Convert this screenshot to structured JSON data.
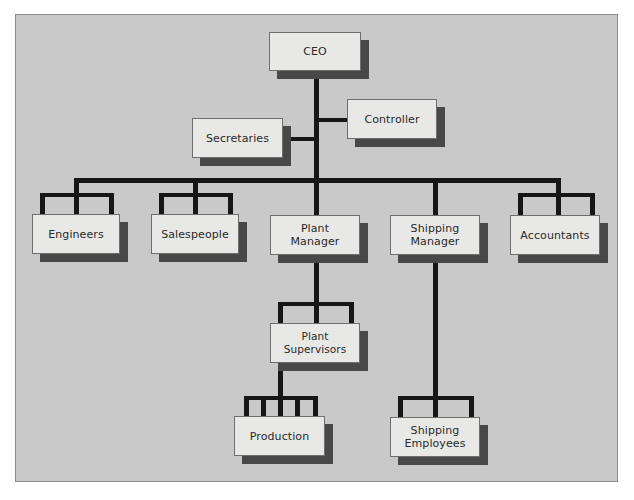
{
  "diagram": {
    "type": "organization-chart",
    "colors": {
      "background": "#c9c9c9",
      "box_fill": "#e8e8e6",
      "box_shadow": "#484848",
      "connector": "#161616"
    },
    "nodes": {
      "ceo": "CEO",
      "controller": "Controller",
      "secretaries": "Secretaries",
      "engineers": "Engineers",
      "salespeople": "Salespeople",
      "plant_manager": "Plant\nManager",
      "shipping_manager": "Shipping\nManager",
      "accountants": "Accountants",
      "plant_supervisors": "Plant Supervisors",
      "production": "Production",
      "shipping_employees": "Shipping\nEmployees"
    },
    "edges": [
      [
        "CEO",
        "Controller"
      ],
      [
        "CEO",
        "Secretaries"
      ],
      [
        "CEO",
        "Engineers"
      ],
      [
        "CEO",
        "Salespeople"
      ],
      [
        "CEO",
        "Plant Manager"
      ],
      [
        "CEO",
        "Shipping Manager"
      ],
      [
        "CEO",
        "Accountants"
      ],
      [
        "Plant Manager",
        "Plant Supervisors"
      ],
      [
        "Plant Supervisors",
        "Production"
      ],
      [
        "Shipping Manager",
        "Shipping Employees"
      ]
    ]
  }
}
